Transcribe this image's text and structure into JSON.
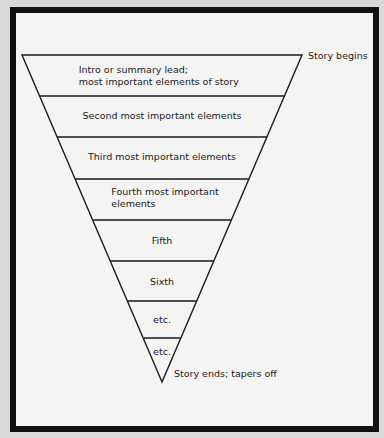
{
  "diagram": {
    "type": "inverted-pyramid",
    "top_annotation": "Story begins",
    "bottom_annotation": "Story ends; tapers off",
    "tiers": [
      {
        "label_line1": "Intro or summary lead;",
        "label_line2": "most important elements of story"
      },
      {
        "label_line1": "Second most important elements",
        "label_line2": ""
      },
      {
        "label_line1": "Third most important elements",
        "label_line2": ""
      },
      {
        "label_line1": "Fourth most important",
        "label_line2": "elements"
      },
      {
        "label_line1": "Fifth",
        "label_line2": ""
      },
      {
        "label_line1": "Sixth",
        "label_line2": ""
      },
      {
        "label_line1": "etc.",
        "label_line2": ""
      },
      {
        "label_line1": "etc.",
        "label_line2": ""
      }
    ]
  },
  "colors": {
    "border": "#111111",
    "background": "#f4f4f2",
    "line": "#1a1a1a"
  }
}
